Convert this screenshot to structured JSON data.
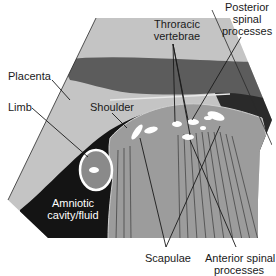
{
  "figure": {
    "type": "ultrasound-anatomy-diagram",
    "colors": {
      "placenta": "#c4c4c4",
      "uterine_wall_dark": "#5c5c5c",
      "amniotic_fluid": "#141414",
      "fetal_body": "#9c9c9c",
      "limb": "#8a8a8a",
      "bone_echo": "#ffffff",
      "background": "#ffffff",
      "leader_line": "#1a1a1a"
    }
  },
  "labels": {
    "placenta": "Placenta",
    "limb": "Limb",
    "shoulder": "Shoulder",
    "thoracic_vertebrae_line1": "Throracic",
    "thoracic_vertebrae_line2": "vertebrae",
    "posterior_spinal_line1": "Posterior",
    "posterior_spinal_line2": "spinal",
    "posterior_spinal_line3": "processes",
    "amniotic_line1": "Amniotic",
    "amniotic_line2": "cavity/fluid",
    "scapulae": "Scapulae",
    "anterior_spinal_line1": "Anterior spinal",
    "anterior_spinal_line2": "processes"
  }
}
